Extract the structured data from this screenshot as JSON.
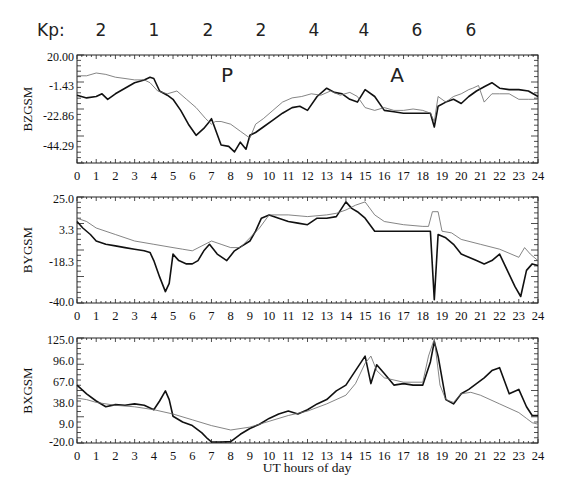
{
  "header": {
    "kp_label": "Kp:",
    "kp_values": [
      "2",
      "1",
      "2",
      "2",
      "4",
      "4",
      "6",
      "6"
    ]
  },
  "x_axis": {
    "label": "UT hours of day",
    "ticks": [
      "0",
      "1",
      "2",
      "3",
      "4",
      "5",
      "6",
      "7",
      "8",
      "9",
      "10",
      "11",
      "12",
      "13",
      "14",
      "15",
      "16",
      "17",
      "18",
      "19",
      "20",
      "21",
      "22",
      "23",
      "24"
    ]
  },
  "panels": [
    {
      "ylabel": "BZGSM",
      "yticks": [
        "20.00",
        "-1.43",
        "-22.86",
        "-44.29"
      ],
      "annotations": [
        "P",
        "A"
      ]
    },
    {
      "ylabel": "BYGSM",
      "yticks": [
        "25.0",
        "3.3",
        "-18.3",
        "-40.0"
      ],
      "annotations": []
    },
    {
      "ylabel": "BXGSM",
      "yticks": [
        "125.0",
        "96.0",
        "67.0",
        "38.0",
        "9.0",
        "-20.0"
      ],
      "annotations": []
    }
  ],
  "chart_data": [
    {
      "type": "line",
      "title": "",
      "xlabel": "",
      "ylabel": "BZGSM",
      "xlim": [
        0,
        24
      ],
      "ylim": [
        -58,
        20
      ],
      "yticks": [
        20.0,
        -1.43,
        -22.86,
        -44.29
      ],
      "annotations": [
        {
          "text": "P",
          "x": 7.8
        },
        {
          "text": "A",
          "x": 16.1
        }
      ],
      "grid": false,
      "series": [
        {
          "name": "observed",
          "x": [
            0,
            0.5,
            1,
            1.3,
            1.6,
            2,
            2.5,
            3,
            3.5,
            3.8,
            4,
            4.3,
            4.7,
            5,
            5.4,
            5.8,
            6.2,
            6.6,
            6.9,
            7.0,
            7.5,
            7.9,
            8.2,
            8.5,
            8.8,
            9.0,
            9.3,
            9.7,
            10.2,
            10.7,
            11.2,
            11.6,
            12.0,
            12.5,
            13.0,
            13.4,
            13.8,
            14.2,
            14.6,
            15.0,
            15.5,
            16.0,
            16.5,
            17.0,
            17.5,
            18.0,
            18.4,
            18.6,
            18.8,
            19.2,
            19.6,
            20.0,
            20.4,
            20.8,
            21.2,
            21.6,
            22.0,
            22.5,
            23.0,
            23.5,
            24
          ],
          "y": [
            -9,
            -11,
            -10,
            -8,
            -12,
            -8,
            -4,
            0,
            2,
            4,
            3,
            -6,
            -9,
            -12,
            -20,
            -30,
            -38,
            -33,
            -28,
            -26,
            -45,
            -46,
            -50,
            -43,
            -48,
            -38,
            -36,
            -32,
            -27,
            -22,
            -18,
            -17,
            -20,
            -10,
            -4,
            -7,
            -8,
            -12,
            -14,
            -5,
            -10,
            -20,
            -21,
            -22,
            -22,
            -22,
            -22,
            -32,
            -17,
            -14,
            -12,
            -15,
            -10,
            -6,
            -3,
            0,
            -4,
            -5,
            -5,
            -6,
            -10
          ]
        },
        {
          "name": "model",
          "x": [
            0,
            0.5,
            1,
            1.5,
            2,
            2.5,
            3,
            3.5,
            3.8,
            4.2,
            4.7,
            5.2,
            5.7,
            6.2,
            6.7,
            7.0,
            7.2,
            7.5,
            8.0,
            8.5,
            8.8,
            9.0,
            9.3,
            9.7,
            10.2,
            10.7,
            11.2,
            11.7,
            12.2,
            12.7,
            13.2,
            13.7,
            14.2,
            14.6,
            15.0,
            15.5,
            16.0,
            16.5,
            17.0,
            17.5,
            18.0,
            18.4,
            18.6,
            18.8,
            19.2,
            19.6,
            20.0,
            20.4,
            20.6,
            20.9,
            21.2,
            21.6,
            22.0,
            22.5,
            23.0,
            23.5,
            24
          ],
          "y": [
            5,
            5,
            7,
            6,
            4,
            3,
            2,
            2,
            0,
            -6,
            -8,
            -6,
            -12,
            -18,
            -26,
            -30,
            -28,
            -28,
            -30,
            -35,
            -38,
            -40,
            -30,
            -26,
            -20,
            -14,
            -11,
            -10,
            -8,
            -9,
            -6,
            -9,
            -7,
            -10,
            -18,
            -20,
            -18,
            -20,
            -20,
            -19,
            -20,
            -22,
            -28,
            -10,
            -14,
            -10,
            -8,
            -5,
            -4,
            -2,
            -14,
            -8,
            -8,
            -8,
            -12,
            -12,
            -12
          ]
        }
      ]
    },
    {
      "type": "line",
      "title": "",
      "xlabel": "",
      "ylabel": "BYGSM",
      "xlim": [
        0,
        24
      ],
      "ylim": [
        -40,
        25
      ],
      "yticks": [
        25.0,
        3.3,
        -18.3,
        -40.0
      ],
      "grid": false,
      "series": [
        {
          "name": "observed",
          "x": [
            0,
            0.3,
            0.7,
            1.0,
            1.5,
            2.0,
            2.5,
            3.0,
            3.5,
            3.8,
            4.0,
            4.3,
            4.6,
            4.8,
            5.0,
            5.3,
            5.7,
            6.0,
            6.3,
            6.6,
            6.9,
            7.3,
            7.8,
            8.2,
            8.6,
            9.0,
            9.3,
            9.6,
            10.0,
            10.5,
            11.0,
            11.5,
            12.0,
            12.5,
            13.0,
            13.5,
            14.0,
            14.3,
            14.6,
            15.0,
            15.5,
            16.0,
            16.5,
            17.0,
            17.5,
            18.0,
            18.4,
            18.6,
            18.8,
            19.2,
            19.6,
            20.0,
            20.4,
            20.8,
            21.2,
            21.6,
            22.0,
            22.4,
            22.8,
            23.1,
            23.4,
            23.7,
            24
          ],
          "y": [
            10,
            6,
            2,
            -2,
            -4,
            -5,
            -6,
            -7,
            -8,
            -9,
            -14,
            -24,
            -33,
            -28,
            -10,
            -14,
            -16,
            -16,
            -14,
            -8,
            -4,
            -10,
            -14,
            -8,
            -5,
            -2,
            4,
            12,
            14,
            12,
            10,
            9,
            8,
            12,
            12,
            13,
            22,
            18,
            16,
            12,
            4,
            4,
            4,
            4,
            4,
            4,
            4,
            -38,
            2,
            0,
            -4,
            -10,
            -12,
            -14,
            -16,
            -14,
            -10,
            -20,
            -30,
            -36,
            -20,
            -16,
            -17
          ]
        },
        {
          "name": "model",
          "x": [
            0,
            0.5,
            1,
            2,
            3,
            4,
            5,
            5.5,
            6,
            6.5,
            7,
            7.5,
            8,
            8.5,
            9,
            9.5,
            10,
            11,
            12,
            13,
            13.5,
            14,
            14.5,
            15,
            15.5,
            16,
            17,
            18,
            18.3,
            18.5,
            18.8,
            19,
            19.5,
            20,
            21,
            22,
            23,
            23.3,
            23.6,
            24
          ],
          "y": [
            12,
            10,
            6,
            2,
            -2,
            -4,
            -6,
            -7,
            -8,
            -5,
            -2,
            -4,
            -6,
            -6,
            0,
            6,
            14,
            14,
            13,
            14,
            15,
            17,
            20,
            22,
            14,
            10,
            8,
            7,
            7,
            16,
            16,
            4,
            3,
            -1,
            -4,
            -7,
            -12,
            -6,
            -10,
            -14
          ]
        }
      ]
    },
    {
      "type": "line",
      "title": "",
      "xlabel": "UT hours of day",
      "ylabel": "BXGSM",
      "xlim": [
        0,
        24
      ],
      "ylim": [
        -20,
        125
      ],
      "yticks": [
        125.0,
        96.0,
        67.0,
        38.0,
        9.0,
        -20.0
      ],
      "grid": false,
      "series": [
        {
          "name": "observed",
          "x": [
            0,
            0.5,
            1,
            1.5,
            2,
            2.5,
            3,
            3.5,
            4,
            4.3,
            4.6,
            4.8,
            5.0,
            5.5,
            6,
            6.5,
            6.8,
            7.0,
            7.5,
            8.0,
            8.5,
            9.0,
            9.5,
            10,
            10.5,
            11,
            11.5,
            12,
            12.5,
            13,
            13.5,
            14,
            14.5,
            15,
            15.3,
            15.6,
            16,
            16.5,
            17,
            17.5,
            18,
            18.4,
            18.6,
            18.8,
            19.2,
            19.6,
            20,
            20.4,
            20.8,
            21.2,
            21.6,
            22,
            22.5,
            23,
            23.4,
            23.7,
            24
          ],
          "y": [
            60,
            48,
            38,
            30,
            33,
            32,
            34,
            32,
            26,
            38,
            52,
            40,
            17,
            9,
            4,
            -6,
            -14,
            -20,
            -20,
            -18,
            -8,
            0,
            6,
            14,
            20,
            24,
            20,
            26,
            34,
            40,
            52,
            60,
            80,
            100,
            62,
            88,
            76,
            60,
            62,
            60,
            60,
            92,
            120,
            100,
            40,
            34,
            48,
            54,
            62,
            70,
            80,
            84,
            48,
            54,
            30,
            18,
            18
          ]
        },
        {
          "name": "model",
          "x": [
            0,
            0.5,
            1,
            2,
            3,
            4,
            5,
            6,
            7,
            8,
            9,
            10,
            11,
            12,
            13,
            14,
            14.5,
            15,
            15.3,
            15.6,
            16,
            17,
            18,
            18.3,
            18.6,
            18.9,
            19.2,
            19.6,
            20,
            20.5,
            21,
            22,
            23,
            23.4,
            23.7,
            24
          ],
          "y": [
            42,
            40,
            36,
            32,
            30,
            26,
            20,
            12,
            4,
            -2,
            2,
            10,
            18,
            24,
            34,
            46,
            62,
            90,
            100,
            80,
            70,
            64,
            64,
            100,
            125,
            60,
            40,
            36,
            48,
            50,
            46,
            34,
            22,
            14,
            8,
            6
          ]
        }
      ]
    }
  ]
}
